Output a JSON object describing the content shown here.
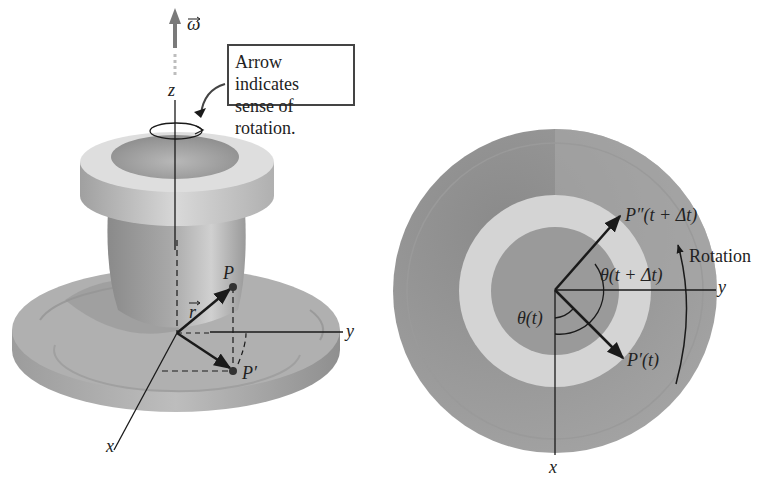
{
  "callout": {
    "line1": "Arrow indicates",
    "line2": "sense of rotation."
  },
  "left_figure": {
    "omega_label": "ω",
    "z_label": "z",
    "y_label": "y",
    "x_label": "x",
    "r_label": "r",
    "p_label": "P",
    "p_prime_label": "P′"
  },
  "right_figure": {
    "p_double_prime_label": "P″(t + Δt)",
    "rotation_label": "Rotation",
    "theta_dt_label": "θ(t + Δt)",
    "theta_label": "θ(t)",
    "p_prime_label": "P′(t)",
    "y_label": "y",
    "x_label": "x"
  },
  "colors": {
    "disc_dark": "#8c8c8c",
    "disc_mid": "#a6a6a6",
    "ring_light": "#d6d6d6",
    "hub": "#9a9a9a",
    "omega_arrow": "#7a7a7a",
    "ink": "#1a1a1a"
  }
}
